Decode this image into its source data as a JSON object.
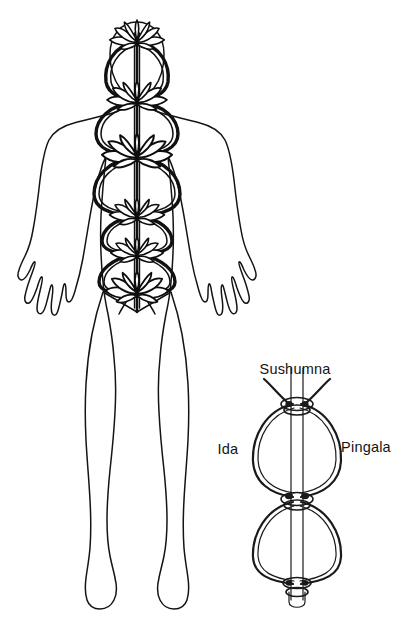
{
  "page": {
    "background_color": "#ffffff",
    "ink_color": "#111111",
    "width": 408,
    "height": 636
  },
  "main_figure": {
    "name": "human-body-outline",
    "description": "Front view outline of a standing human figure with arms held slightly away from the body and fingers splayed",
    "chakras": [
      {
        "index": 1,
        "name": "crown-lotus",
        "position_label": "Crown",
        "cx": 137,
        "cy": 41,
        "petal_count": 8,
        "scale": 1.05
      },
      {
        "index": 2,
        "name": "throat-lotus",
        "position_label": "Throat",
        "cx": 137,
        "cy": 101,
        "petal_count": 8,
        "scale": 1.15
      },
      {
        "index": 3,
        "name": "heart-lotus",
        "position_label": "Heart",
        "cx": 137,
        "cy": 156,
        "petal_count": 8,
        "scale": 1.3
      },
      {
        "index": 4,
        "name": "navel-lotus",
        "position_label": "Navel",
        "cx": 137,
        "cy": 216,
        "petal_count": 8,
        "scale": 1.1
      },
      {
        "index": 5,
        "name": "sacral-lotus",
        "position_label": "Sacral",
        "cx": 137,
        "cy": 254,
        "petal_count": 8,
        "scale": 1.05
      },
      {
        "index": 6,
        "name": "root-lotus",
        "position_label": "Root",
        "cx": 137,
        "cy": 292,
        "petal_count": 8,
        "scale": 1.2
      }
    ],
    "central_channel": {
      "name": "sushumna-central-channel",
      "top_y": 30,
      "bottom_y": 312
    }
  },
  "detail_figure": {
    "name": "nadi-detail-diagram",
    "labels": {
      "center": "Sushumna",
      "left": "Ida",
      "right": "Pingala"
    },
    "label_positions": {
      "center": {
        "x": 295,
        "y": 374
      },
      "left": {
        "x": 228,
        "y": 454
      },
      "right": {
        "x": 366,
        "y": 452
      }
    },
    "crossings": [
      {
        "name": "upper-crossing",
        "y": 404
      },
      {
        "name": "middle-crossing",
        "y": 497
      },
      {
        "name": "lower-crossing",
        "y": 583
      }
    ],
    "channel": {
      "top_y": 368,
      "bottom_y": 610,
      "cx": 297,
      "half_width": 6
    }
  },
  "caption": {
    "ghost_text": ""
  }
}
